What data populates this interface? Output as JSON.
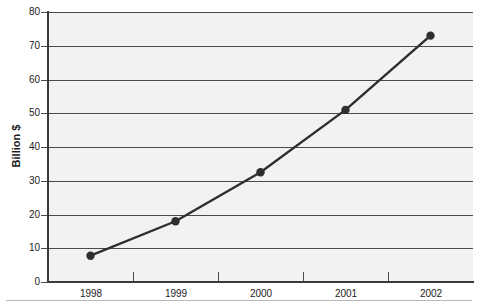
{
  "chart_data": {
    "type": "line",
    "title": "",
    "title_note": "cropped",
    "xlabel": "",
    "ylabel": "Billion $",
    "categories": [
      "1998",
      "1999",
      "2000",
      "2001",
      "2002"
    ],
    "values": [
      7.8,
      18,
      32.5,
      51,
      73
    ],
    "series": [
      {
        "name": "Billion $",
        "values": [
          7.8,
          18,
          32.5,
          51,
          73
        ]
      }
    ],
    "ylim": [
      0,
      80
    ],
    "ytick_values": [
      0,
      10,
      20,
      30,
      40,
      50,
      60,
      70,
      80
    ],
    "ytick_labels": [
      "0",
      "10",
      "20",
      "30",
      "40",
      "50",
      "60",
      "70",
      "80"
    ],
    "xtick_labels": [
      "1998",
      "1999",
      "2000",
      "2001",
      "2002"
    ],
    "grid": "horizontal",
    "legend": "none",
    "marker": "circle",
    "line_color": "#2e2e2e",
    "marker_color": "#2e2e2e",
    "plot_background": "#f2f2f2",
    "page_background": "#ffffff",
    "axis_color": "#3a3a3a",
    "gridline_color": "#4a4a4a"
  },
  "axis": {
    "y_title": "Billion $"
  },
  "ticks": {
    "y": [
      {
        "label": "80"
      },
      {
        "label": "70"
      },
      {
        "label": "60"
      },
      {
        "label": "50"
      },
      {
        "label": "40"
      },
      {
        "label": "30"
      },
      {
        "label": "20"
      },
      {
        "label": "10"
      },
      {
        "label": "0"
      }
    ],
    "x": [
      {
        "label": "1998"
      },
      {
        "label": "1999"
      },
      {
        "label": "2000"
      },
      {
        "label": "2001"
      },
      {
        "label": "2002"
      }
    ]
  }
}
